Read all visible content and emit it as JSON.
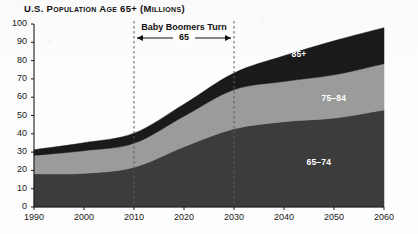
{
  "chart_data": {
    "type": "area",
    "title": "U.S. Population Age 65+ (Millions)",
    "xlabel": "",
    "ylabel": "",
    "stacked": true,
    "grid": false,
    "legend_position": "inline-labels",
    "x": [
      1990,
      2000,
      2010,
      2020,
      2030,
      2040,
      2050,
      2060
    ],
    "xlim": [
      1990,
      2060
    ],
    "ylim": [
      0,
      100
    ],
    "xticks": [
      "1990",
      "2000",
      "2010",
      "2020",
      "2030",
      "2040",
      "2050",
      "2060"
    ],
    "yticks": [
      "0",
      "10",
      "20",
      "30",
      "40",
      "50",
      "60",
      "70",
      "80",
      "90",
      "100"
    ],
    "series": [
      {
        "name": "65–74",
        "color": "#3c3c3c",
        "values": [
          18.1,
          18.4,
          21.7,
          32.9,
          42.7,
          46.6,
          48.6,
          53.0
        ]
      },
      {
        "name": "75–84",
        "color": "#9b9b9b",
        "values": [
          10.1,
          12.4,
          13.1,
          16.7,
          21.4,
          22.0,
          23.6,
          25.3
        ]
      },
      {
        "name": "85+",
        "color": "#1a1a1a",
        "values": [
          3.1,
          4.3,
          5.5,
          6.6,
          9.1,
          14.0,
          18.6,
          19.7
        ]
      }
    ],
    "annotation": {
      "title": "Baby Boomers Turn",
      "subtitle": "65",
      "start_year": 2010,
      "end_year": 2030,
      "marker_style": "dashed-vertical-with-double-arrow"
    },
    "band_labels": [
      {
        "text": "85+",
        "year": 2043,
        "value": 83
      },
      {
        "text": "75–84",
        "year": 2050,
        "value": 59
      },
      {
        "text": "65–74",
        "year": 2047,
        "value": 24
      }
    ],
    "axis_color": "#1a1a1a",
    "background": "#fdfdfd"
  }
}
